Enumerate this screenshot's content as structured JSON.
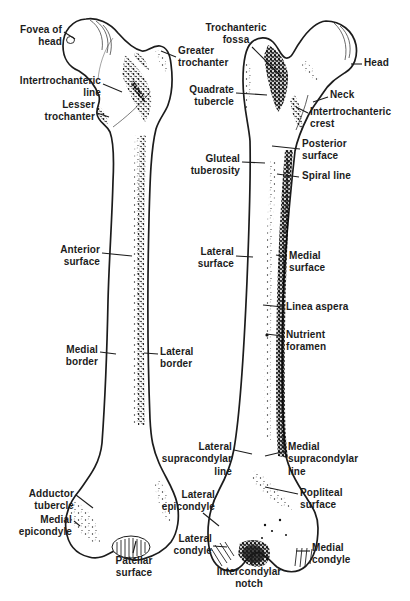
{
  "figure": {
    "colors": {
      "ink": "#1c1c1c",
      "paper": "#ffffff"
    },
    "anterior_view": {
      "labels": {
        "fovea_of_head": "Fovea of\nhead",
        "greater_trochanter": "Greater\ntrochanter",
        "intertrochanteric_line": "Intertrochanteric\nline",
        "lesser_trochanter": "Lesser\ntrochanter",
        "anterior_surface": "Anterior\nsurface",
        "medial_border": "Medial\nborder",
        "lateral_border": "Lateral\nborder",
        "adductor_tubercle": "Adductor\ntubercle",
        "medial_epicondyle": "Medial\nepicondyle",
        "patellar_surface": "Patellar\nsurface"
      }
    },
    "posterior_view": {
      "labels": {
        "trochanteric_fossa": "Trochanteric\nfossa",
        "quadrate_tubercle": "Quadrate\ntubercle",
        "head": "Head",
        "neck": "Neck",
        "intertrochanteric_crest": "Intertrochanteric\ncrest",
        "posterior_surface": "Posterior\nsurface",
        "spiral_line": "Spiral line",
        "gluteal_tuberosity": "Gluteal\ntuberosity",
        "lateral_surface": "Lateral\nsurface",
        "medial_surface": "Medial\nsurface",
        "linea_aspera": "Linea aspera",
        "nutrient_foramen": "Nutrient\nforamen",
        "lateral_supracondylar_line": "Lateral\nsupracondylar\nline",
        "medial_supracondylar_line": "Medial\nsupracondylar\nline",
        "popliteal_surface": "Popliteal\nsurface",
        "lateral_epicondyle": "Lateral\nepicondyle",
        "lateral_condyle": "Lateral\ncondyle",
        "medial_condyle": "Medial\ncondyle",
        "intercondylar_notch": "Intercondylar\nnotch"
      }
    }
  }
}
